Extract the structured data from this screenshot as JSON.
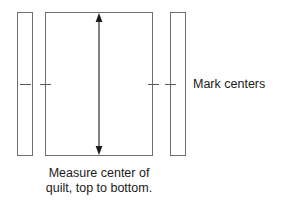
{
  "diagram": {
    "title": "Measure center of quilt, top to bottom",
    "type": "quilt-border-measuring-diagram",
    "canvas": {
      "width": 283,
      "height": 200,
      "background": "#ffffff"
    },
    "colors": {
      "outline": "#6e6e6e",
      "arrow": "#1a1a1a",
      "tick": "#5a5a5a",
      "text": "#1a1a1a",
      "fill": "#ffffff"
    },
    "shapes": {
      "left_border_strip": {
        "name": "left border strip",
        "x": 17,
        "y": 12,
        "width": 16,
        "height": 144
      },
      "quilt_body": {
        "name": "quilt center",
        "x": 45,
        "y": 12,
        "width": 108,
        "height": 144
      },
      "right_border_strip": {
        "name": "right border strip",
        "x": 170,
        "y": 12,
        "width": 16,
        "height": 144
      }
    },
    "measure_arrow": {
      "name": "vertical double-headed measurement arrow",
      "orientation": "vertical",
      "double_headed": true,
      "x": 99,
      "y_top": 16,
      "y_bottom": 152
    },
    "tick_marks": [
      {
        "name": "left strip center mark",
        "x": 20,
        "y": 84,
        "length": 11
      },
      {
        "name": "quilt left center mark",
        "x": 40,
        "y": 84,
        "length": 11
      },
      {
        "name": "quilt right center mark",
        "x": 148,
        "y": 84,
        "length": 11
      },
      {
        "name": "right strip center mark",
        "x": 165,
        "y": 84,
        "length": 11
      }
    ]
  },
  "labels": {
    "mark_centers": "Mark centers",
    "caption_line1": "Measure center of",
    "caption_line2": "quilt, top to bottom."
  }
}
